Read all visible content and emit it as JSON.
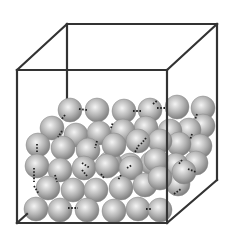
{
  "diagram": {
    "title": "",
    "colors": {
      "box_edge": "#333333",
      "sphere_light": "#f4f4f4",
      "sphere_mid": "#b4b4b4",
      "sphere_dark": "#7a7a7a",
      "bond": "#222222",
      "background": "#ffffff"
    },
    "box": {
      "front": {
        "x1": 17,
        "y1": 70,
        "x2": 167,
        "y2": 223
      },
      "back": {
        "x1": 67,
        "y1": 24,
        "x2": 217,
        "y2": 180
      }
    },
    "sphere_radius": 12,
    "spheres_back": [
      [
        70,
        110
      ],
      [
        97,
        110
      ],
      [
        124,
        111
      ],
      [
        150,
        110
      ],
      [
        177,
        107
      ],
      [
        203,
        108
      ],
      [
        203,
        126
      ],
      [
        189,
        130
      ],
      [
        170,
        131
      ],
      [
        146,
        128
      ],
      [
        123,
        131
      ],
      [
        200,
        146
      ],
      [
        179,
        144
      ],
      [
        160,
        141
      ],
      [
        138,
        141
      ],
      [
        196,
        163
      ],
      [
        176,
        165
      ],
      [
        152,
        163
      ],
      [
        130,
        165
      ],
      [
        110,
        163
      ]
    ],
    "spheres_mid": [
      [
        52,
        128
      ],
      [
        76,
        135
      ],
      [
        99,
        133
      ],
      [
        38,
        145
      ],
      [
        63,
        148
      ],
      [
        88,
        150
      ],
      [
        114,
        145
      ],
      [
        37,
        166
      ],
      [
        60,
        170
      ],
      [
        84,
        168
      ],
      [
        107,
        166
      ],
      [
        131,
        168
      ],
      [
        156,
        160
      ],
      [
        178,
        184
      ],
      [
        184,
        172
      ]
    ],
    "spheres_front": [
      [
        48,
        188
      ],
      [
        73,
        190
      ],
      [
        96,
        190
      ],
      [
        121,
        188
      ],
      [
        145,
        185
      ],
      [
        160,
        178
      ],
      [
        36,
        209
      ],
      [
        60,
        210
      ],
      [
        87,
        210
      ],
      [
        114,
        211
      ],
      [
        138,
        209
      ],
      [
        160,
        210
      ]
    ],
    "bonds": [
      [
        [
          79,
          109
        ],
        [
          87,
          110
        ]
      ],
      [
        [
          65,
          115
        ],
        [
          61,
          120
        ]
      ],
      [
        [
          133,
          111
        ],
        [
          141,
          111
        ]
      ],
      [
        [
          157,
          108
        ],
        [
          167,
          108
        ]
      ],
      [
        [
          153,
          104
        ],
        [
          158,
          100
        ]
      ],
      [
        [
          37,
          144
        ],
        [
          37,
          153
        ]
      ],
      [
        [
          62,
          131
        ],
        [
          58,
          137
        ]
      ],
      [
        [
          97,
          141
        ],
        [
          95,
          148
        ]
      ],
      [
        [
          111,
          128
        ],
        [
          113,
          122
        ]
      ],
      [
        [
          139,
          145
        ],
        [
          135,
          152
        ]
      ],
      [
        [
          146,
          138
        ],
        [
          141,
          144
        ]
      ],
      [
        [
          192,
          134
        ],
        [
          190,
          140
        ]
      ],
      [
        [
          197,
          114
        ],
        [
          195,
          120
        ]
      ],
      [
        [
          127,
          168
        ],
        [
          132,
          165
        ]
      ],
      [
        [
          182,
          160
        ],
        [
          178,
          165
        ]
      ],
      [
        [
          34,
          168
        ],
        [
          34,
          182
        ]
      ],
      [
        [
          34,
          186
        ],
        [
          39,
          194
        ]
      ],
      [
        [
          55,
          175
        ],
        [
          57,
          182
        ]
      ],
      [
        [
          82,
          170
        ],
        [
          87,
          176
        ]
      ],
      [
        [
          101,
          174
        ],
        [
          104,
          178
        ]
      ],
      [
        [
          121,
          175
        ],
        [
          118,
          180
        ]
      ],
      [
        [
          68,
          208
        ],
        [
          78,
          208
        ]
      ],
      [
        [
          146,
          209
        ],
        [
          152,
          209
        ]
      ],
      [
        [
          174,
          194
        ],
        [
          181,
          189
        ]
      ],
      [
        [
          188,
          169
        ],
        [
          196,
          172
        ]
      ],
      [
        [
          82,
          163
        ],
        [
          90,
          168
        ]
      ]
    ]
  }
}
